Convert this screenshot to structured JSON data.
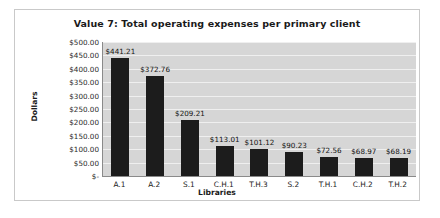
{
  "chart_data": {
    "type": "bar",
    "title": "Value 7: Total operating expenses per primary client",
    "xlabel": "Libraries",
    "ylabel": "Dollars",
    "categories": [
      "A.1",
      "A.2",
      "S.1",
      "C.H.1",
      "T.H.3",
      "S.2",
      "T.H.1",
      "C.H.2",
      "T.H.2"
    ],
    "values": [
      441.21,
      372.76,
      209.21,
      113.01,
      101.12,
      90.23,
      72.56,
      68.97,
      68.19
    ],
    "data_labels": [
      "$441.21",
      "$372.76",
      "$209.21",
      "$113.01",
      "$101.12",
      "$90.23",
      "$72.56",
      "$68.97",
      "$68.19"
    ],
    "ylim": [
      0,
      500
    ],
    "ytick_values": [
      500,
      450,
      400,
      350,
      300,
      250,
      200,
      150,
      100,
      50,
      0
    ],
    "ytick_labels": [
      "$500.00",
      "$450.00",
      "$400.00",
      "$350.00",
      "$300.00",
      "$250.00",
      "$200.00",
      "$150.00",
      "$100.00",
      "$50.00",
      "$-"
    ],
    "grid": "horizontal",
    "legend": "none",
    "colors": {
      "bar": "#1c1c1c",
      "plot_background": "#d6d6d6",
      "gridline": "#efefef",
      "axis": "#8a8a8a",
      "frame": "#c9c9c9",
      "text": "#1a1a1a"
    }
  }
}
